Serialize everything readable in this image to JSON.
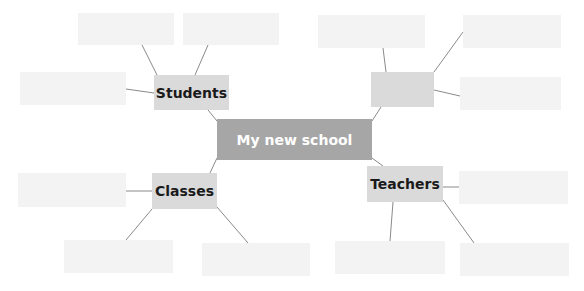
{
  "diagram": {
    "type": "mind-map",
    "center": {
      "label": "My new school"
    },
    "branches": [
      {
        "id": "students",
        "label": "Students",
        "leaves": [
          "",
          "",
          ""
        ]
      },
      {
        "id": "unlabeled",
        "label": "",
        "leaves": [
          "",
          "",
          ""
        ]
      },
      {
        "id": "classes",
        "label": "Classes",
        "leaves": [
          "",
          "",
          ""
        ]
      },
      {
        "id": "teachers",
        "label": "Teachers",
        "leaves": [
          "",
          "",
          ""
        ]
      }
    ]
  },
  "colors": {
    "center_bg": "#a6a6a6",
    "branch_bg": "#dadada",
    "leaf_bg": "#f3f3f3",
    "line": "#8a8a8a"
  }
}
